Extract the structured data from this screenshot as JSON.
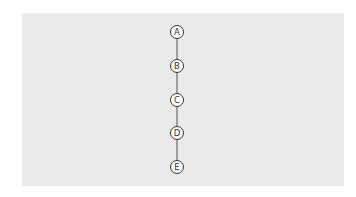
{
  "diagram": {
    "type": "linear-chain",
    "nodes": [
      {
        "id": "A",
        "label": "A",
        "cx": 177,
        "cy": 32
      },
      {
        "id": "B",
        "label": "B",
        "cx": 177,
        "cy": 66
      },
      {
        "id": "C",
        "label": "C",
        "cx": 177,
        "cy": 100
      },
      {
        "id": "D",
        "label": "D",
        "cx": 177,
        "cy": 133
      },
      {
        "id": "E",
        "label": "E",
        "cx": 177,
        "cy": 167
      }
    ],
    "edges": [
      {
        "from": "A",
        "to": "B"
      },
      {
        "from": "B",
        "to": "C"
      },
      {
        "from": "C",
        "to": "D"
      },
      {
        "from": "D",
        "to": "E"
      }
    ],
    "colors": {
      "background": "#eaeaea",
      "stroke": "#444444",
      "node_fill": "#ffffff"
    }
  }
}
